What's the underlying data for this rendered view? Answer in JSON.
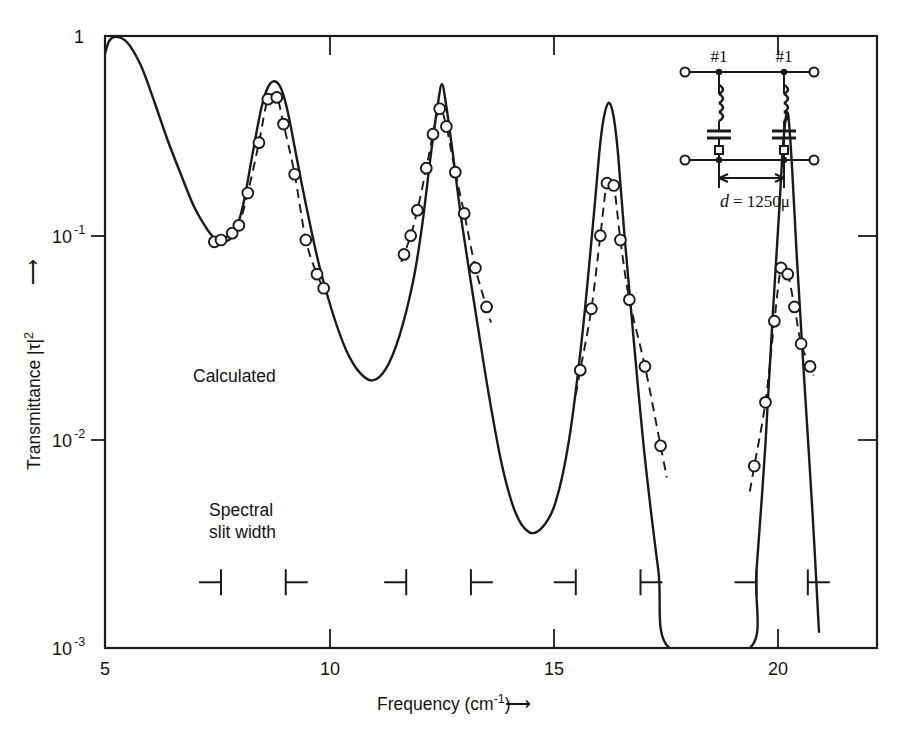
{
  "figure": {
    "background_color": "#ffffff",
    "line_color": "#1a1a1a"
  },
  "axes": {
    "x": {
      "label_text": "Frequency (cm",
      "label_exp": "-1",
      "label_tail": ")",
      "label_arrow": "⟶",
      "ticks": [
        "5",
        "10",
        "15",
        "20"
      ],
      "tick_values": [
        5,
        10,
        15,
        20
      ],
      "range": [
        5,
        22.3
      ]
    },
    "y": {
      "label_text": "Transmittance |τ|",
      "label_exp": "2",
      "label_arrow": "⟶",
      "ticks": [
        "1",
        "10",
        "10",
        "10"
      ],
      "tick_exps": [
        "",
        "-1",
        "-2",
        "-3"
      ],
      "tick_values": [
        1,
        0.1,
        0.01,
        0.001
      ],
      "scale": "log",
      "range": [
        0.001,
        1
      ]
    }
  },
  "annotations": {
    "calculated_label": "Calculated",
    "slit_label_line1": "Spectral",
    "slit_label_line2": "slit width"
  },
  "inset": {
    "label_left": "#1",
    "label_right": "#1",
    "dimension": "d = 1250μ",
    "dimension_italic_d": "d",
    "dimension_rest": "= 1250μ"
  },
  "chart_data": {
    "type": "line",
    "title": "",
    "xlabel": "Frequency (cm^-1)",
    "ylabel": "Transmittance |tau|^2",
    "xlim": [
      5,
      22.3
    ],
    "ylim": [
      0.001,
      1
    ],
    "yscale": "log",
    "grid": false,
    "legend_position": "inline-annotation",
    "series": [
      {
        "name": "Calculated",
        "style": "solid",
        "marker": "none",
        "x": [
          5.0,
          5.1,
          5.25,
          5.5,
          5.8,
          6.1,
          6.4,
          6.7,
          7.0,
          7.3,
          7.5,
          7.7,
          7.9,
          8.1,
          8.3,
          8.5,
          8.65,
          8.8,
          8.95,
          9.1,
          9.3,
          9.5,
          9.8,
          10.1,
          10.4,
          10.7,
          11.0,
          11.3,
          11.6,
          11.9,
          12.1,
          12.3,
          12.45,
          12.55,
          12.65,
          12.8,
          13.0,
          13.3,
          13.6,
          13.9,
          14.2,
          14.5,
          14.8,
          15.1,
          15.4,
          15.7,
          15.95,
          16.1,
          16.2,
          16.3,
          16.4,
          16.5,
          16.65,
          16.85,
          17.1,
          17.4,
          17.65,
          19.45,
          19.6,
          19.8,
          19.95,
          20.1,
          20.2,
          20.3,
          20.4,
          20.5,
          20.65,
          20.85,
          21.0
        ],
        "y": [
          0.82,
          0.95,
          0.99,
          0.93,
          0.72,
          0.48,
          0.31,
          0.21,
          0.145,
          0.112,
          0.1,
          0.098,
          0.108,
          0.15,
          0.26,
          0.44,
          0.56,
          0.6,
          0.55,
          0.42,
          0.25,
          0.15,
          0.075,
          0.044,
          0.029,
          0.0225,
          0.0205,
          0.0235,
          0.034,
          0.062,
          0.115,
          0.26,
          0.45,
          0.58,
          0.45,
          0.26,
          0.12,
          0.045,
          0.0175,
          0.0078,
          0.0046,
          0.0037,
          0.0039,
          0.0052,
          0.0105,
          0.035,
          0.13,
          0.3,
          0.42,
          0.47,
          0.4,
          0.26,
          0.1,
          0.032,
          0.0085,
          0.0024,
          0.001,
          0.001,
          0.0024,
          0.01,
          0.038,
          0.13,
          0.3,
          0.42,
          0.22,
          0.085,
          0.024,
          0.0048,
          0.0012
        ]
      },
      {
        "name": "Measured",
        "style": "dashed",
        "marker": "open-circle",
        "x": [
          7.45,
          7.6,
          7.85,
          8.0,
          8.2,
          8.45,
          8.65,
          8.85,
          9.0,
          9.25,
          9.5,
          9.75,
          9.9,
          11.7,
          11.85,
          12.0,
          12.2,
          12.35,
          12.5,
          12.65,
          12.85,
          13.05,
          13.3,
          13.55,
          15.65,
          15.9,
          16.1,
          16.25,
          16.4,
          16.55,
          16.75,
          17.1,
          17.45,
          19.55,
          19.8,
          20.0,
          20.15,
          20.3,
          20.45,
          20.6,
          20.8
        ],
        "y": [
          0.098,
          0.1,
          0.108,
          0.118,
          0.17,
          0.3,
          0.49,
          0.5,
          0.37,
          0.21,
          0.1,
          0.068,
          0.058,
          0.085,
          0.105,
          0.14,
          0.225,
          0.33,
          0.44,
          0.36,
          0.215,
          0.135,
          0.073,
          0.047,
          0.023,
          0.046,
          0.105,
          0.19,
          0.185,
          0.1,
          0.051,
          0.024,
          0.0098,
          0.0078,
          0.016,
          0.04,
          0.073,
          0.068,
          0.047,
          0.031,
          0.024
        ]
      }
    ],
    "slit_width_markers": [
      {
        "left": 7.6,
        "right": 9.05
      },
      {
        "left": 11.75,
        "right": 13.2
      },
      {
        "left": 15.55,
        "right": 17.0
      },
      {
        "left": 19.6,
        "right": 20.75
      }
    ],
    "slit_marker_y": 0.0021,
    "annotations": [
      {
        "text": "Calculated",
        "x": 8.05,
        "y": 0.0245
      },
      {
        "text": "Spectral",
        "x": 8.2,
        "y": 0.0052
      },
      {
        "text": "slit width",
        "x": 8.2,
        "y": 0.0038
      }
    ]
  }
}
